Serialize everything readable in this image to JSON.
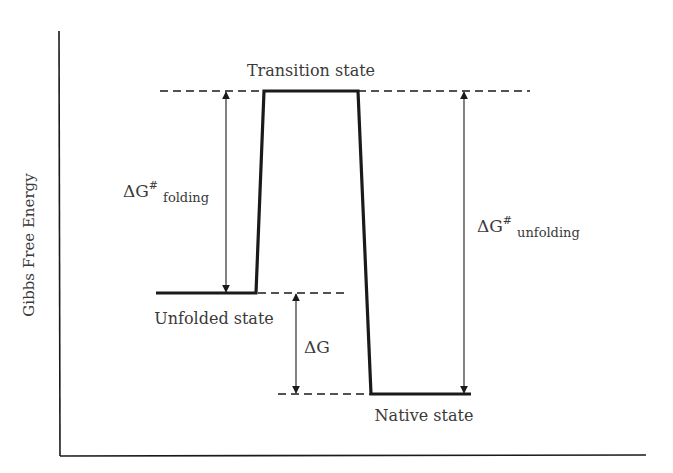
{
  "diagram": {
    "type": "energy-level-diagram",
    "title": "",
    "axes": {
      "y_label": "Gibbs Free Energy",
      "x_label": ""
    },
    "states": [
      {
        "id": "transition",
        "label": "Transition state",
        "relative_level": "highest"
      },
      {
        "id": "unfolded",
        "label": "Unfolded state",
        "relative_level": "intermediate"
      },
      {
        "id": "native",
        "label": "Native state",
        "relative_level": "lowest"
      }
    ],
    "annotations": {
      "dg_folding": {
        "symbol": "ΔG",
        "superscript": "#",
        "subscript": "folding",
        "from": "unfolded",
        "to": "transition"
      },
      "dg_unfolding": {
        "symbol": "ΔG",
        "superscript": "#",
        "subscript": "unfolding",
        "from": "native",
        "to": "transition"
      },
      "dg": {
        "symbol": "ΔG",
        "from": "native",
        "to": "unfolded"
      }
    },
    "colors": {
      "line": "#1a1a1a",
      "text": "#3a3a3a",
      "background": "#ffffff"
    }
  }
}
